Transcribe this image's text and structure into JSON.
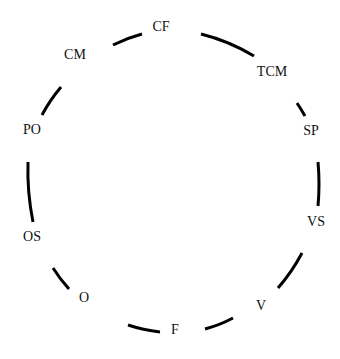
{
  "diagram": {
    "type": "cycle",
    "stroke_color": "#000000",
    "label_color": "#111111",
    "nodes": [
      {
        "id": "CF",
        "label": "CF",
        "x": 161,
        "y": 27
      },
      {
        "id": "TCM",
        "label": "TCM",
        "x": 272,
        "y": 72
      },
      {
        "id": "SP",
        "label": "SP",
        "x": 311,
        "y": 131
      },
      {
        "id": "VS",
        "label": "VS",
        "x": 316,
        "y": 222
      },
      {
        "id": "V",
        "label": "V",
        "x": 261,
        "y": 306
      },
      {
        "id": "F",
        "label": "F",
        "x": 175,
        "y": 330
      },
      {
        "id": "O",
        "label": "O",
        "x": 84,
        "y": 298
      },
      {
        "id": "OS",
        "label": "OS",
        "x": 32,
        "y": 237
      },
      {
        "id": "PO",
        "label": "PO",
        "x": 32,
        "y": 130
      },
      {
        "id": "CM",
        "label": "CM",
        "x": 75,
        "y": 55
      }
    ],
    "arcs": [
      {
        "from": "CM",
        "to": "CF",
        "d": "M113 45 Q127 38 142 34"
      },
      {
        "from": "CF",
        "to": "TCM",
        "d": "M201 34 Q229 41 254 56"
      },
      {
        "from": "TCM",
        "to": "SP",
        "d": "M297 103 Q301 109 305 116"
      },
      {
        "from": "SP",
        "to": "VS",
        "d": "M318 162 Q320 184 318 206"
      },
      {
        "from": "VS",
        "to": "V",
        "d": "M302 253 Q292 272 278 288"
      },
      {
        "from": "V",
        "to": "F",
        "d": "M233 318 Q220 325 205 329"
      },
      {
        "from": "F",
        "to": "O",
        "d": "M160 332 Q143 330 128 325"
      },
      {
        "from": "O",
        "to": "OS",
        "d": "M69 289 Q60 279 53 268"
      },
      {
        "from": "OS",
        "to": "PO",
        "d": "M33 222 Q27 192 28 162"
      },
      {
        "from": "PO",
        "to": "CM",
        "d": "M42 115 Q50 100 61 87"
      }
    ]
  }
}
